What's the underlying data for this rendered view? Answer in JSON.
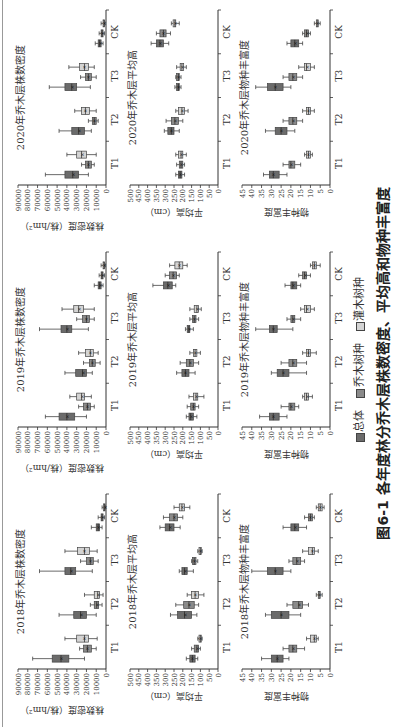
{
  "figure": {
    "caption": "图6-1  各年度林分乔木层株数密度、平均高和物种丰富度",
    "legend": [
      {
        "label": "总体",
        "color": "#6b6b6b"
      },
      {
        "label": "乔木树种",
        "color": "#8a8a8a"
      },
      {
        "label": "灌木树种",
        "color": "#d4d4d4"
      }
    ]
  },
  "chart_data": [
    {
      "type": "box",
      "title": "2018年乔木层株数密度",
      "ylabel": "株数密度（株/hm²）",
      "ylim": [
        0,
        90000
      ],
      "yticks": [
        0,
        10000,
        20000,
        30000,
        40000,
        50000,
        60000,
        70000,
        80000,
        90000
      ],
      "categories": [
        "T1",
        "T2",
        "T3",
        "CK"
      ],
      "series": [
        {
          "name": "总体",
          "boxes": [
            [
              22000,
              38000,
              46000,
              55000,
              75000
            ],
            [
              10000,
              20000,
              26000,
              33000,
              48000
            ],
            [
              14000,
              31000,
              36000,
              42000,
              68000
            ],
            [
              4000,
              6500,
              8000,
              10000,
              15000
            ]
          ]
        },
        {
          "name": "乔木树种",
          "boxes": [
            [
              10000,
              15000,
              19000,
              23000,
              27000
            ],
            [
              4000,
              7500,
              9500,
              12000,
              16000
            ],
            [
              8000,
              13000,
              16000,
              20000,
              26000
            ],
            [
              1500,
              3000,
              4000,
              5000,
              8000
            ]
          ]
        },
        {
          "name": "灌木树种",
          "boxes": [
            [
              9000,
              18000,
              22000,
              30000,
              42000
            ],
            [
              3000,
              6500,
              8500,
              12000,
              22000
            ],
            [
              9000,
              17000,
              22000,
              29000,
              42000
            ],
            [
              500,
              1000,
              1500,
              2500,
              4000
            ]
          ]
        }
      ]
    },
    {
      "type": "box",
      "title": "2019年乔木层株数密度",
      "ylabel": "株数密度（株/hm²）",
      "ylim": [
        0,
        90000
      ],
      "yticks": [
        0,
        10000,
        20000,
        30000,
        40000,
        50000,
        60000,
        70000,
        80000,
        90000
      ],
      "categories": [
        "T1",
        "T2",
        "T3",
        "CK"
      ],
      "series": [
        {
          "name": "总体",
          "boxes": [
            [
              20000,
              32000,
              40000,
              48000,
              62000
            ],
            [
              14000,
              20000,
              24000,
              31000,
              42000
            ],
            [
              18000,
              35000,
              40000,
              46000,
              68000
            ],
            [
              3000,
              5000,
              6500,
              8000,
              12000
            ]
          ]
        },
        {
          "name": "乔木树种",
          "boxes": [
            [
              12000,
              16000,
              19000,
              23000,
              28000
            ],
            [
              6000,
              11000,
              14000,
              17000,
              23000
            ],
            [
              12000,
              17000,
              20000,
              24000,
              30000
            ],
            [
              1500,
              3000,
              4000,
              5000,
              7000
            ]
          ]
        },
        {
          "name": "灌木树种",
          "boxes": [
            [
              15000,
              22000,
              25000,
              30000,
              37000
            ],
            [
              8000,
              13000,
              16000,
              21000,
              28000
            ],
            [
              12000,
              23000,
              28000,
              33000,
              45000
            ],
            [
              800,
              1500,
              2000,
              3000,
              5000
            ]
          ]
        }
      ]
    },
    {
      "type": "box",
      "title": "2020年乔木层株数密度",
      "ylabel": "株数密度（株/hm²）",
      "ylim": [
        0,
        90000
      ],
      "yticks": [
        0,
        10000,
        20000,
        30000,
        40000,
        50000,
        60000,
        70000,
        80000,
        90000
      ],
      "categories": [
        "T1",
        "T2",
        "T3",
        "CK"
      ],
      "series": [
        {
          "name": "总体",
          "boxes": [
            [
              18000,
              28000,
              34000,
              42000,
              62000
            ],
            [
              15000,
              22000,
              28000,
              35000,
              48000
            ],
            [
              16000,
              30000,
              35000,
              42000,
              58000
            ],
            [
              3000,
              5000,
              6500,
              8000,
              11000
            ]
          ]
        },
        {
          "name": "乔木树种",
          "boxes": [
            [
              12000,
              15000,
              18000,
              21000,
              25000
            ],
            [
              8000,
              10000,
              12000,
              14000,
              18000
            ],
            [
              10000,
              15000,
              18000,
              21000,
              26000
            ],
            [
              1500,
              3000,
              4000,
              5000,
              7000
            ]
          ]
        },
        {
          "name": "灌木树种",
          "boxes": [
            [
              10000,
              20000,
              25000,
              30000,
              40000
            ],
            [
              10000,
              17000,
              21000,
              25000,
              32000
            ],
            [
              12000,
              18000,
              22000,
              27000,
              38000
            ],
            [
              1000,
              1500,
              2000,
              3000,
              5000
            ]
          ]
        }
      ]
    },
    {
      "type": "box",
      "title": "2018年乔木层平均高",
      "ylabel": "平均高（cm）",
      "ylim": [
        0,
        500
      ],
      "yticks": [
        0,
        50,
        100,
        150,
        200,
        250,
        300,
        350,
        400,
        450,
        500
      ],
      "categories": [
        "T1",
        "T2",
        "T3",
        "CK"
      ],
      "series": [
        {
          "name": "总体",
          "boxes": [
            [
              115,
              130,
              145,
              160,
              180
            ],
            [
              120,
              150,
              190,
              230,
              270
            ],
            [
              140,
              175,
              190,
              205,
              220
            ],
            [
              215,
              250,
              275,
              300,
              330
            ]
          ]
        },
        {
          "name": "乔木树种",
          "boxes": [
            [
              100,
              110,
              120,
              135,
              150
            ],
            [
              110,
              135,
              165,
              195,
              240
            ],
            [
              115,
              125,
              135,
              145,
              150
            ],
            [
              200,
              230,
              250,
              275,
              310
            ]
          ]
        },
        {
          "name": "灌木树种",
          "boxes": [
            [
              90,
              95,
              100,
              108,
              115
            ],
            [
              80,
              110,
              130,
              150,
              175
            ],
            [
              90,
              95,
              100,
              108,
              115
            ],
            [
              160,
              190,
              205,
              220,
              250
            ]
          ]
        }
      ]
    },
    {
      "type": "box",
      "title": "2019年乔木层平均高",
      "ylabel": "平均高（cm）",
      "ylim": [
        0,
        500
      ],
      "yticks": [
        0,
        50,
        100,
        150,
        200,
        250,
        300,
        350,
        400,
        450,
        500
      ],
      "categories": [
        "T1",
        "T2",
        "T3",
        "CK"
      ],
      "series": [
        {
          "name": "总体",
          "boxes": [
            [
              120,
              140,
              155,
              165,
              180
            ],
            [
              130,
              165,
              185,
              205,
              235
            ],
            [
              140,
              160,
              165,
              175,
              185
            ],
            [
              240,
              260,
              285,
              310,
              370
            ]
          ]
        },
        {
          "name": "乔木树种",
          "boxes": [
            [
              110,
              130,
              140,
              155,
              175
            ],
            [
              110,
              140,
              160,
              180,
              215
            ],
            [
              110,
              125,
              135,
              145,
              160
            ],
            [
              220,
              235,
              255,
              275,
              300
            ]
          ]
        },
        {
          "name": "灌木树种",
          "boxes": [
            [
              80,
              115,
              125,
              140,
              165
            ],
            [
              100,
              120,
              130,
              140,
              160
            ],
            [
              95,
              110,
              120,
              135,
              160
            ],
            [
              175,
              200,
              220,
              245,
              275
            ]
          ]
        }
      ]
    },
    {
      "type": "box",
      "title": "2020年乔木层平均高",
      "ylabel": "平均高（cm）",
      "ylim": [
        0,
        500
      ],
      "yticks": [
        0,
        50,
        100,
        150,
        200,
        250,
        300,
        350,
        400,
        450,
        500
      ],
      "categories": [
        "T1",
        "T2",
        "T3",
        "CK"
      ],
      "series": [
        {
          "name": "总体",
          "boxes": [
            [
              190,
              205,
              215,
              225,
              240
            ],
            [
              220,
              250,
              265,
              285,
              305
            ],
            [
              210,
              220,
              225,
              235,
              245
            ],
            [
              280,
              310,
              330,
              350,
              380
            ]
          ]
        },
        {
          "name": "乔木树种",
          "boxes": [
            [
              190,
              200,
              210,
              220,
              235
            ],
            [
              200,
              225,
              245,
              265,
              295
            ],
            [
              210,
              220,
              225,
              235,
              240
            ],
            [
              270,
              295,
              310,
              330,
              350
            ]
          ]
        },
        {
          "name": "灌木树种",
          "boxes": [
            [
              180,
              200,
              210,
              225,
              240
            ],
            [
              170,
              190,
              205,
              225,
              240
            ],
            [
              180,
              195,
              205,
              215,
              235
            ],
            [
              220,
              240,
              245,
              255,
              265
            ]
          ]
        }
      ]
    },
    {
      "type": "box",
      "title": "2018年乔木层物种丰富度",
      "ylabel": "物种丰富度",
      "ylim": [
        0,
        45
      ],
      "yticks": [
        0,
        5,
        10,
        15,
        20,
        25,
        30,
        35,
        40,
        45
      ],
      "categories": [
        "T1",
        "T2",
        "T3",
        "CK"
      ],
      "series": [
        {
          "name": "总体",
          "boxes": [
            [
              21,
              24,
              27,
              30,
              35
            ],
            [
              15,
              21,
              25,
              30,
              33
            ],
            [
              20,
              24,
              28,
              32,
              40
            ],
            [
              12,
              16,
              18,
              20,
              24
            ]
          ]
        },
        {
          "name": "乔木树种",
          "boxes": [
            [
              13,
              17,
              19,
              21,
              24
            ],
            [
              11,
              14,
              16,
              19,
              22
            ],
            [
              13,
              15,
              17,
              19,
              21
            ],
            [
              8,
              9,
              10,
              11,
              13
            ]
          ]
        },
        {
          "name": "灌木树种",
          "boxes": [
            [
              6,
              7,
              8,
              10,
              12
            ],
            [
              4,
              5,
              5.5,
              6,
              7
            ],
            [
              6,
              8,
              9,
              11,
              14
            ],
            [
              3,
              4,
              5,
              6,
              7
            ]
          ]
        }
      ]
    },
    {
      "type": "box",
      "title": "2019年乔木层物种丰富度",
      "ylabel": "物种丰富度",
      "ylim": [
        0,
        45
      ],
      "yticks": [
        0,
        5,
        10,
        15,
        20,
        25,
        30,
        35,
        40,
        45
      ],
      "categories": [
        "T1",
        "T2",
        "T3",
        "CK"
      ],
      "series": [
        {
          "name": "总体",
          "boxes": [
            [
              22,
              26,
              29,
              31,
              36
            ],
            [
              12,
              21,
              24,
              27,
              30
            ],
            [
              19,
              27,
              29,
              31,
              38
            ],
            [
              15,
              17,
              19,
              20,
              23
            ]
          ]
        },
        {
          "name": "乔木树种",
          "boxes": [
            [
              16,
              18,
              20,
              21,
              25
            ],
            [
              12,
              17,
              19,
              21,
              25
            ],
            [
              15,
              18,
              19,
              20,
              22
            ],
            [
              10,
              12,
              13,
              14,
              16
            ]
          ]
        },
        {
          "name": "灌木树种",
          "boxes": [
            [
              9,
              11,
              12,
              13,
              14
            ],
            [
              7,
              10,
              11,
              12,
              14
            ],
            [
              8,
              10,
              12,
              13,
              15
            ],
            [
              5,
              7,
              8,
              9,
              10
            ]
          ]
        }
      ]
    },
    {
      "type": "box",
      "title": "2020年乔木层物种丰富度",
      "ylabel": "物种丰富度",
      "ylim": [
        0,
        45
      ],
      "yticks": [
        0,
        5,
        10,
        15,
        20,
        25,
        30,
        35,
        40,
        45
      ],
      "categories": [
        "T1",
        "T2",
        "T3",
        "CK"
      ],
      "series": [
        {
          "name": "总体",
          "boxes": [
            [
              22,
              26,
              29,
              31,
              34
            ],
            [
              18,
              22,
              25,
              28,
              33
            ],
            [
              20,
              24,
              28,
              32,
              38
            ],
            [
              14,
              16,
              18,
              20,
              22
            ]
          ]
        },
        {
          "name": "乔木树种",
          "boxes": [
            [
              15,
              18,
              20,
              21,
              24
            ],
            [
              14,
              17,
              19,
              21,
              24
            ],
            [
              14,
              17,
              19,
              21,
              24
            ],
            [
              10,
              11,
              12,
              13,
              14
            ]
          ]
        },
        {
          "name": "灌木树种",
          "boxes": [
            [
              9,
              10,
              11,
              12,
              13
            ],
            [
              8,
              10,
              11,
              12,
              14
            ],
            [
              8,
              10,
              12,
              13,
              16
            ],
            [
              5,
              6,
              6.5,
              7,
              8
            ]
          ]
        }
      ]
    }
  ]
}
